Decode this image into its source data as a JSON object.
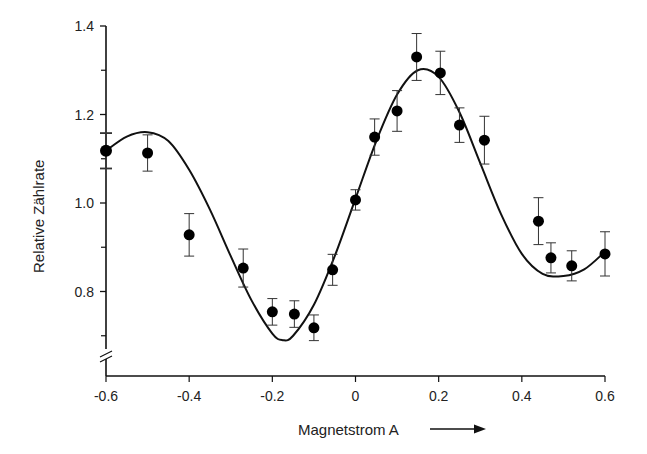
{
  "chart_data": {
    "type": "scatter",
    "title": "",
    "xlabel": "Magnetstrom  A",
    "ylabel": "Relative Zählrate",
    "xlim": [
      -0.6,
      0.6
    ],
    "ylim": [
      0.65,
      1.4
    ],
    "y_axis_break": true,
    "grid": false,
    "x_ticks": [
      -0.6,
      -0.4,
      -0.2,
      0,
      0.2,
      0.4,
      0.6
    ],
    "x_tick_labels": [
      "-0.6",
      "-0.4",
      "-0.2",
      "0",
      "0.2",
      "0.4",
      "0.6"
    ],
    "y_ticks": [
      0.8,
      1.0,
      1.2,
      1.4
    ],
    "y_tick_labels": [
      "0.8",
      "1.0",
      "1.2",
      "1.4"
    ],
    "y_minor_ticks": [
      0.7,
      0.9,
      1.1,
      1.3
    ],
    "series": [
      {
        "name": "Messwerte",
        "kind": "points-with-errorbars",
        "x": [
          -0.6,
          -0.5,
          -0.4,
          -0.27,
          -0.2,
          -0.147,
          -0.1,
          -0.055,
          0.0,
          0.046,
          0.1,
          0.147,
          0.204,
          0.25,
          0.31,
          0.44,
          0.47,
          0.52,
          0.6
        ],
        "y": [
          1.118,
          1.113,
          0.928,
          0.853,
          0.754,
          0.749,
          0.718,
          0.849,
          1.007,
          1.149,
          1.208,
          1.33,
          1.294,
          1.176,
          1.142,
          0.959,
          0.876,
          0.858,
          0.885
        ],
        "err": [
          0.04,
          0.041,
          0.048,
          0.043,
          0.03,
          0.03,
          0.029,
          0.035,
          0.023,
          0.041,
          0.046,
          0.053,
          0.049,
          0.039,
          0.054,
          0.053,
          0.034,
          0.034,
          0.05
        ]
      },
      {
        "name": "Fit",
        "kind": "line",
        "x": [
          -0.6,
          -0.55,
          -0.5,
          -0.45,
          -0.4,
          -0.35,
          -0.3,
          -0.25,
          -0.2,
          -0.175,
          -0.15,
          -0.1,
          -0.05,
          0.0,
          0.05,
          0.1,
          0.15,
          0.2,
          0.25,
          0.3,
          0.35,
          0.4,
          0.45,
          0.5,
          0.55,
          0.6
        ],
        "y": [
          1.118,
          1.15,
          1.16,
          1.14,
          1.075,
          0.985,
          0.88,
          0.78,
          0.705,
          0.69,
          0.7,
          0.77,
          0.88,
          1.01,
          1.14,
          1.245,
          1.3,
          1.285,
          1.205,
          1.09,
          0.975,
          0.885,
          0.84,
          0.835,
          0.85,
          0.89
        ]
      }
    ],
    "arrow": "right"
  }
}
